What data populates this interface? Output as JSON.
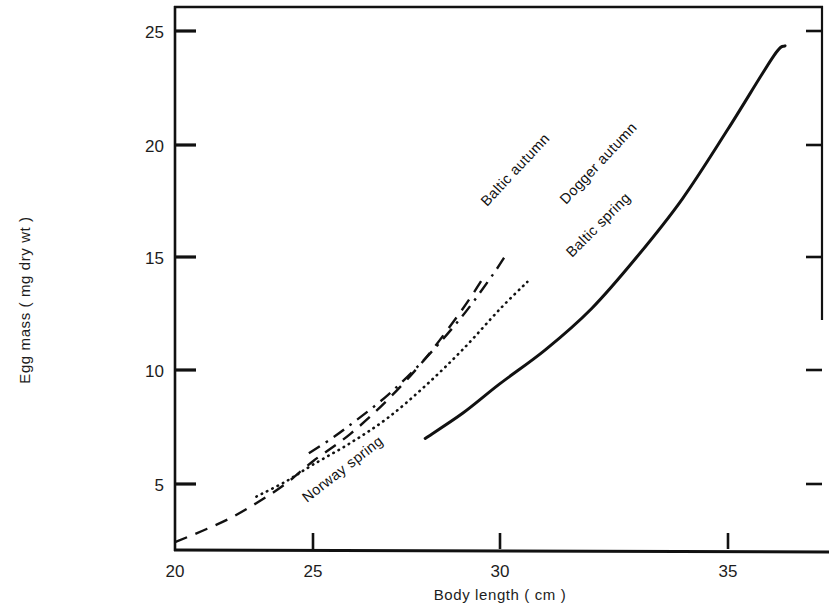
{
  "chart_data": {
    "type": "line",
    "title": "",
    "xlabel": "Body length ( cm )",
    "ylabel": "Egg mass ( mg dry wt )",
    "xlim": [
      20,
      36.8
    ],
    "ylim": [
      2.1,
      26.0
    ],
    "xticks": [
      20,
      25,
      30,
      35
    ],
    "xtick_labels": [
      "20",
      "25",
      "30",
      "35"
    ],
    "yticks": [
      5,
      10,
      15,
      20,
      25
    ],
    "ytick_labels": [
      "5",
      "10",
      "15",
      "20",
      "25"
    ],
    "grid": false,
    "legend": "inline-curve-labels",
    "series": [
      {
        "name": "Baltic autumn",
        "style": "dashed",
        "color": "#111111",
        "label_angle": -47,
        "points": [
          [
            20.0,
            2.45
          ],
          [
            21.0,
            2.95
          ],
          [
            22.0,
            3.5
          ],
          [
            23.0,
            4.2
          ],
          [
            24.0,
            5.0
          ],
          [
            25.0,
            6.0
          ],
          [
            26.0,
            7.2
          ],
          [
            27.0,
            8.7
          ],
          [
            28.0,
            10.5
          ],
          [
            29.0,
            12.7
          ],
          [
            29.6,
            14.2
          ]
        ]
      },
      {
        "name": "Dogger autumn",
        "style": "dash-dot",
        "color": "#111111",
        "label_angle": -47,
        "points": [
          [
            24.85,
            6.35
          ],
          [
            25.5,
            7.0
          ],
          [
            26.0,
            7.6
          ],
          [
            27.0,
            8.9
          ],
          [
            28.0,
            10.5
          ],
          [
            29.0,
            12.4
          ],
          [
            29.8,
            14.2
          ],
          [
            30.1,
            15.0
          ]
        ]
      },
      {
        "name": "Baltic spring",
        "style": "dotted",
        "color": "#111111",
        "label_angle": -45,
        "points": [
          [
            22.95,
            4.45
          ],
          [
            24.0,
            5.1
          ],
          [
            25.0,
            5.85
          ],
          [
            26.0,
            6.8
          ],
          [
            27.0,
            7.9
          ],
          [
            28.0,
            9.3
          ],
          [
            29.0,
            10.9
          ],
          [
            30.0,
            12.7
          ],
          [
            30.6,
            13.9
          ]
        ]
      },
      {
        "name": "Norway spring",
        "style": "solid",
        "color": "#111111",
        "label_angle": -38,
        "points": [
          [
            28.0,
            7.0
          ],
          [
            29.0,
            8.1
          ],
          [
            30.0,
            9.4
          ],
          [
            31.0,
            10.9
          ],
          [
            32.0,
            12.7
          ],
          [
            33.0,
            15.0
          ],
          [
            34.0,
            17.6
          ],
          [
            35.0,
            20.7
          ],
          [
            36.0,
            23.9
          ],
          [
            36.25,
            24.35
          ]
        ]
      }
    ]
  },
  "axes": {
    "x_axis_title": "Body length ( cm )",
    "y_axis_title": "Egg mass ( mg dry wt )"
  },
  "series_labels": {
    "baltic_autumn": "Baltic autumn",
    "dogger_autumn": "Dogger autumn",
    "baltic_spring": "Baltic spring",
    "norway_spring": "Norway spring"
  }
}
